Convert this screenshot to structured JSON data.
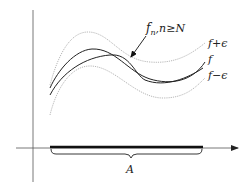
{
  "diagram": {
    "labels": {
      "fn": "f",
      "fn_sub": "n",
      "fn_cond": ",n≥N",
      "f_plus": "f+ϵ",
      "f": "f",
      "f_minus": "f−ϵ",
      "set": "A"
    },
    "curves": [
      {
        "name": "f-plus-epsilon",
        "style": "dotted",
        "color": "#b8b8b8"
      },
      {
        "name": "f",
        "style": "solid",
        "color": "#222222"
      },
      {
        "name": "f-n",
        "style": "solid",
        "color": "#222222"
      },
      {
        "name": "f-minus-epsilon",
        "style": "dotted",
        "color": "#b8b8b8"
      }
    ],
    "colors": {
      "axis": "#555555",
      "band": "#b8b8b8",
      "curve": "#222222",
      "interval": "#111111"
    }
  }
}
